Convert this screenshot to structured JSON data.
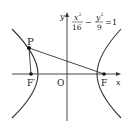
{
  "diagram": {
    "type": "hyperbola-focal-diagram",
    "equation": {
      "x_term_num": "x",
      "x_term_exp": "2",
      "x_term_den": "16",
      "minus": "−",
      "y_term_num": "y",
      "y_term_exp": "2",
      "y_term_den": "9",
      "equals": "=",
      "rhs": "1"
    },
    "axes": {
      "x_label": "x",
      "y_label": "y",
      "origin_label": "O"
    },
    "points": {
      "P": "P",
      "F": "F",
      "F_prime": "F′"
    },
    "colors": {
      "stroke": "#333333",
      "background": "#ffffff"
    }
  }
}
